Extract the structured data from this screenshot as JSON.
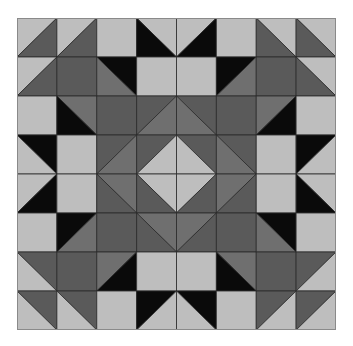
{
  "palette": {
    "L": "#bebebe",
    "D": "#5a5a5a",
    "M": "#6f6f6f",
    "K": "#0a0a0a",
    "line": "#2a2a2a"
  },
  "quilt": {
    "rows": 8,
    "cols": 8,
    "cell_legend": "S=solid color; '/'=diagonal bottom-left to top-right with [top-left, bottom-right] colors; '\\'=diagonal top-left to bottom-right with [top-right, bottom-left] colors",
    "grid": [
      [
        [
          "/",
          "L",
          "D"
        ],
        [
          "/",
          "L",
          "D"
        ],
        [
          "S",
          "L"
        ],
        [
          "\\",
          "L",
          "K"
        ],
        [
          "/",
          "L",
          "K"
        ],
        [
          "S",
          "L"
        ],
        [
          "\\",
          "L",
          "D"
        ],
        [
          "\\",
          "L",
          "D"
        ]
      ],
      [
        [
          "/",
          "L",
          "D"
        ],
        [
          "S",
          "D"
        ],
        [
          "\\",
          "K",
          "M"
        ],
        [
          "S",
          "L"
        ],
        [
          "S",
          "L"
        ],
        [
          "/",
          "K",
          "M"
        ],
        [
          "S",
          "D"
        ],
        [
          "\\",
          "L",
          "D"
        ]
      ],
      [
        [
          "S",
          "L"
        ],
        [
          "\\",
          "M",
          "K"
        ],
        [
          "S",
          "D"
        ],
        [
          "/",
          "D",
          "M"
        ],
        [
          "\\",
          "D",
          "M"
        ],
        [
          "S",
          "D"
        ],
        [
          "/",
          "M",
          "K"
        ],
        [
          "S",
          "L"
        ]
      ],
      [
        [
          "\\",
          "K",
          "L"
        ],
        [
          "S",
          "L"
        ],
        [
          "/",
          "D",
          "M"
        ],
        [
          "/",
          "D",
          "L"
        ],
        [
          "\\",
          "D",
          "L"
        ],
        [
          "\\",
          "D",
          "M"
        ],
        [
          "S",
          "L"
        ],
        [
          "/",
          "K",
          "L"
        ]
      ],
      [
        [
          "/",
          "L",
          "K"
        ],
        [
          "S",
          "L"
        ],
        [
          "\\",
          "M",
          "D"
        ],
        [
          "\\",
          "L",
          "D"
        ],
        [
          "/",
          "L",
          "D"
        ],
        [
          "/",
          "M",
          "D"
        ],
        [
          "S",
          "L"
        ],
        [
          "\\",
          "L",
          "K"
        ]
      ],
      [
        [
          "S",
          "L"
        ],
        [
          "/",
          "K",
          "M"
        ],
        [
          "S",
          "D"
        ],
        [
          "\\",
          "M",
          "D"
        ],
        [
          "/",
          "M",
          "D"
        ],
        [
          "S",
          "D"
        ],
        [
          "\\",
          "K",
          "M"
        ],
        [
          "S",
          "L"
        ]
      ],
      [
        [
          "\\",
          "D",
          "L"
        ],
        [
          "S",
          "D"
        ],
        [
          "/",
          "M",
          "K"
        ],
        [
          "S",
          "L"
        ],
        [
          "S",
          "L"
        ],
        [
          "\\",
          "M",
          "K"
        ],
        [
          "S",
          "D"
        ],
        [
          "/",
          "D",
          "L"
        ]
      ],
      [
        [
          "\\",
          "D",
          "L"
        ],
        [
          "\\",
          "D",
          "L"
        ],
        [
          "S",
          "L"
        ],
        [
          "/",
          "K",
          "L"
        ],
        [
          "\\",
          "K",
          "L"
        ],
        [
          "S",
          "L"
        ],
        [
          "/",
          "D",
          "L"
        ],
        [
          "/",
          "D",
          "L"
        ]
      ]
    ]
  }
}
